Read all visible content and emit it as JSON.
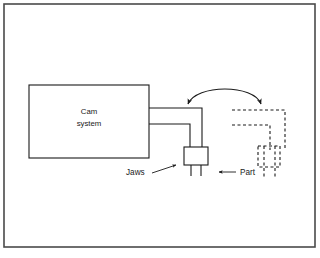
{
  "figure": {
    "type": "engineering-schematic",
    "title_text": "",
    "canvas": {
      "width": 320,
      "height": 258
    },
    "colors": {
      "background": "#ffffff",
      "stroke": "#1a1a1a",
      "frame": "#4a4a4a",
      "text": "#1a1a1a"
    },
    "frame": {
      "name": "outer-border",
      "x": 4,
      "y": 4,
      "width": 311,
      "height": 243,
      "stroke_width": 1.6
    }
  },
  "nodes": {
    "cam_system": {
      "label_line1": "Cam",
      "label_line2": "system",
      "x": 29,
      "y": 85,
      "width": 120,
      "height": 73,
      "stroke_width": 1.1
    },
    "jaws_block": {
      "x": 185,
      "y": 148,
      "width": 22,
      "height": 17,
      "stroke_width": 1.1
    },
    "phantom_jaws_block": {
      "x": 258,
      "y": 146,
      "width": 22,
      "height": 21,
      "stroke_width": 1.1,
      "dash": "3,2.5"
    }
  },
  "arm": {
    "name": "robot-arm-solid",
    "upper_line_y": 108,
    "lower_line_y": 124,
    "start_x": 149,
    "elbow_outer_x": 202,
    "elbow_inner_x": 190,
    "down_to_y": 150,
    "stroke_width": 1.1
  },
  "phantom_arm": {
    "name": "robot-arm-phantom",
    "upper_line_y": 110,
    "lower_line_y": 125,
    "start_x": 232,
    "elbow_outer_x": 285,
    "elbow_inner_x": 270,
    "down_to_y": 148,
    "stroke_width": 1.1,
    "dash": "3,2.5"
  },
  "motion_arc": {
    "name": "swing-motion-arrow",
    "path": "M 188,104 C 196,84 254,84 261,104",
    "double_headed": true,
    "stroke_width": 1.1
  },
  "labels": [
    {
      "id": "jaws",
      "text": "Jaws",
      "text_x": 126,
      "text_y": 175,
      "leader": "M 152,173 L 176,165",
      "arrow_tip_x": 184,
      "arrow_tip_y": 161,
      "anchor": "start"
    },
    {
      "id": "part",
      "text": "Part",
      "text_x": 240,
      "text_y": 175,
      "leader": "M 236,172 L 219,172",
      "arrow_tip_x": 208,
      "arrow_tip_y": 172,
      "anchor": "start"
    }
  ],
  "prongs": {
    "name": "jaw-prongs",
    "left_x": 191,
    "right_x": 201,
    "top_y": 134,
    "bottom_y": 176
  },
  "phantom_prongs": {
    "name": "phantom-jaw-prongs",
    "left_x": 264,
    "right_x": 274,
    "top_y": 132,
    "bottom_y": 178
  }
}
